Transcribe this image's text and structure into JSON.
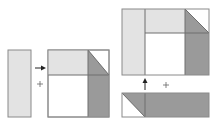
{
  "colors": {
    "light": "#e3e3e3",
    "dark": "#9a9a9a",
    "white": "#ffffff",
    "stroke": "#8a8a8a",
    "divider": "#6f6f6f",
    "arrow": "#222222"
  },
  "symbols": {
    "plus": "+"
  },
  "diagram": {
    "step1": {
      "label": "strip-plus-square"
    },
    "step2": {
      "label": "composite-plus-bottom-strip"
    }
  }
}
